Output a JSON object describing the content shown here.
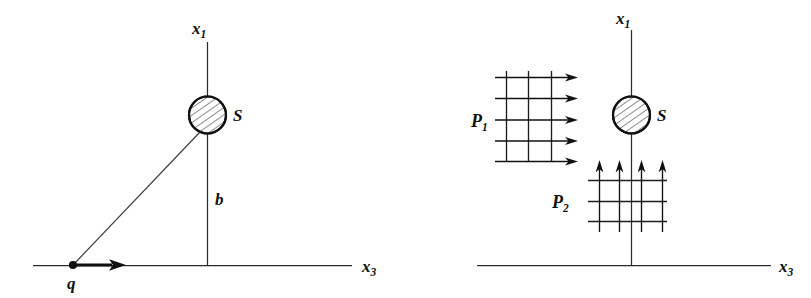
{
  "figure": {
    "stroke_color": "#111111",
    "axis_color": "#2b2b2b",
    "background": "#ffffff",
    "panels": [
      {
        "id": "left",
        "name": "charge-trajectory-panel",
        "axes": {
          "vertical": {
            "label_base": "x",
            "label_sub": "1"
          },
          "horizontal": {
            "label_base": "x",
            "label_sub": "3"
          }
        },
        "labels": {
          "sphere": "S",
          "impact_parameter": "b",
          "charge": "q"
        }
      },
      {
        "id": "right",
        "name": "field-decomposition-panel",
        "axes": {
          "vertical": {
            "label_base": "x",
            "label_sub": "1"
          },
          "horizontal": {
            "label_base": "x",
            "label_sub": "3"
          }
        },
        "labels": {
          "sphere": "S",
          "field_1_base": "P",
          "field_1_sub": "1",
          "field_2_base": "P",
          "field_2_sub": "2"
        },
        "grids": {
          "p1": {
            "horizontal_lines": 5,
            "vertical_lines": 3,
            "arrow_direction": "right"
          },
          "p2": {
            "horizontal_lines": 3,
            "vertical_lines": 4,
            "arrow_direction": "up"
          }
        }
      }
    ]
  }
}
